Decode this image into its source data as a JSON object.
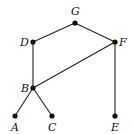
{
  "diagram": {
    "type": "lattice",
    "nodes": [
      {
        "id": "G",
        "label": "G",
        "x": 75,
        "y": 23,
        "lx": 71,
        "ly": 15
      },
      {
        "id": "D",
        "label": "D",
        "x": 33,
        "y": 42,
        "lx": 20,
        "ly": 46
      },
      {
        "id": "F",
        "label": "F",
        "x": 115,
        "y": 42,
        "lx": 119,
        "ly": 46
      },
      {
        "id": "B",
        "label": "B",
        "x": 33,
        "y": 88,
        "lx": 21,
        "ly": 92
      },
      {
        "id": "A",
        "label": "A",
        "x": 15,
        "y": 116,
        "lx": 11,
        "ly": 131
      },
      {
        "id": "C",
        "label": "C",
        "x": 52,
        "y": 116,
        "lx": 48,
        "ly": 131
      },
      {
        "id": "E",
        "label": "E",
        "x": 115,
        "y": 116,
        "lx": 111,
        "ly": 131
      }
    ],
    "edges": [
      [
        "G",
        "D"
      ],
      [
        "G",
        "F"
      ],
      [
        "D",
        "B"
      ],
      [
        "F",
        "B"
      ],
      [
        "B",
        "A"
      ],
      [
        "B",
        "C"
      ],
      [
        "F",
        "E"
      ]
    ]
  }
}
